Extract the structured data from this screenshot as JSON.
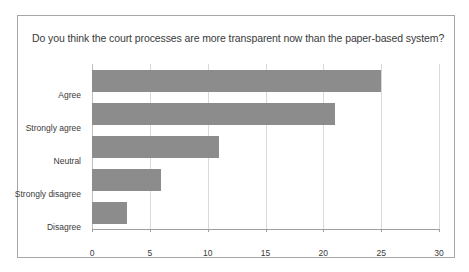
{
  "chart_data": {
    "type": "bar",
    "orientation": "horizontal",
    "title": "Do you think the court processes are more transparent now than the paper-based system?",
    "categories": [
      "Agree",
      "Strongly agree",
      "Neutral",
      "Strongly disagree",
      "Disagree"
    ],
    "values": [
      25,
      21,
      11,
      6,
      3
    ],
    "xlabel": "",
    "ylabel": "",
    "xlim": [
      0,
      30
    ],
    "xticks": [
      0,
      5,
      10,
      15,
      20,
      25,
      30
    ],
    "xtick_labels": [
      "0",
      "5",
      "10",
      "15",
      "20",
      "25",
      "30"
    ],
    "grid": true,
    "grid_axis": "x",
    "legend": false,
    "bar_color": "#8c8c8c",
    "gridline_color": "#d9d9d9",
    "axis_color": "#9e9e9e",
    "border_color": "#a6a6a6",
    "text_color": "#3a3a3a",
    "background": "#ffffff"
  }
}
